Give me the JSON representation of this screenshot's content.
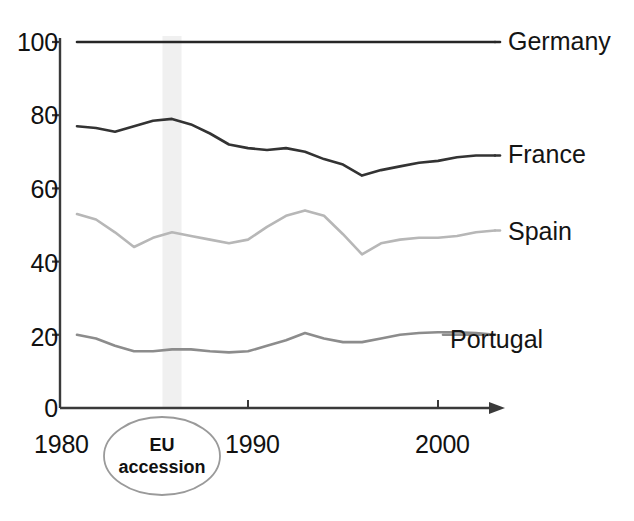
{
  "figure": {
    "background_color": "#ffffff",
    "axis_color": "#3a3a3a"
  },
  "axes": {
    "y_ticks": [
      "100",
      "80",
      "60",
      "40",
      "20",
      "0"
    ],
    "x_ticks": [
      "1980",
      "1990",
      "2000"
    ],
    "y_range": [
      0,
      100
    ],
    "x_range": [
      1980,
      2004
    ]
  },
  "annotation": {
    "line1": "EU",
    "line2": "accession",
    "shade_color": "#f0f0f0",
    "ellipse_color": "#9a9a9a",
    "band_years": [
      1985.5,
      1986.5
    ]
  },
  "series_labels": {
    "germany": "Germany",
    "france": "France",
    "spain": "Spain",
    "portugal": "Portugal"
  },
  "chart_data": {
    "type": "line",
    "title": "",
    "xlabel": "",
    "ylabel": "",
    "xlim": [
      1980,
      2004
    ],
    "ylim": [
      0,
      100
    ],
    "grid": false,
    "legend_position": "right-of-line-ends",
    "x": [
      1981,
      1982,
      1983,
      1984,
      1985,
      1986,
      1987,
      1988,
      1989,
      1990,
      1991,
      1992,
      1993,
      1994,
      1995,
      1996,
      1997,
      1998,
      1999,
      2000,
      2001,
      2002,
      2003
    ],
    "series": [
      {
        "name": "Germany",
        "color": "#262626",
        "width": 2.6,
        "values": [
          100,
          100,
          100,
          100,
          100,
          100,
          100,
          100,
          100,
          100,
          100,
          100,
          100,
          100,
          100,
          100,
          100,
          100,
          100,
          100,
          100,
          100,
          100
        ]
      },
      {
        "name": "France",
        "color": "#333333",
        "width": 2.6,
        "values": [
          77,
          76.5,
          75.5,
          77,
          78.5,
          79,
          77.5,
          75,
          72,
          71,
          70.5,
          71,
          70,
          68,
          66.5,
          63.5,
          65,
          66,
          67,
          67.5,
          68.5,
          69,
          69
        ]
      },
      {
        "name": "Spain",
        "color": "#b7b7b7",
        "width": 2.6,
        "values": [
          53,
          51.5,
          48,
          44,
          46.5,
          48,
          47,
          46,
          45,
          46,
          49.5,
          52.5,
          54,
          52.5,
          47.5,
          42,
          45,
          46,
          46.5,
          46.5,
          47,
          48,
          48.5
        ]
      },
      {
        "name": "Portugal",
        "color": "#8c8c8c",
        "width": 2.6,
        "values": [
          20,
          19,
          17,
          15.5,
          15.5,
          16,
          16,
          15.5,
          15.2,
          15.5,
          17,
          18.5,
          20.5,
          19,
          18,
          18,
          19,
          20,
          20.5,
          20.7,
          20.7,
          20.5,
          20
        ]
      }
    ]
  }
}
